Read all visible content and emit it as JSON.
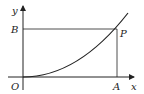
{
  "diagram": {
    "type": "coordinate-plot",
    "labels": {
      "y_axis": "y",
      "x_axis": "x",
      "origin": "O",
      "point_a": "A",
      "point_b": "B",
      "point_p": "P"
    },
    "colors": {
      "stroke": "#222222",
      "background": "#ffffff"
    }
  }
}
